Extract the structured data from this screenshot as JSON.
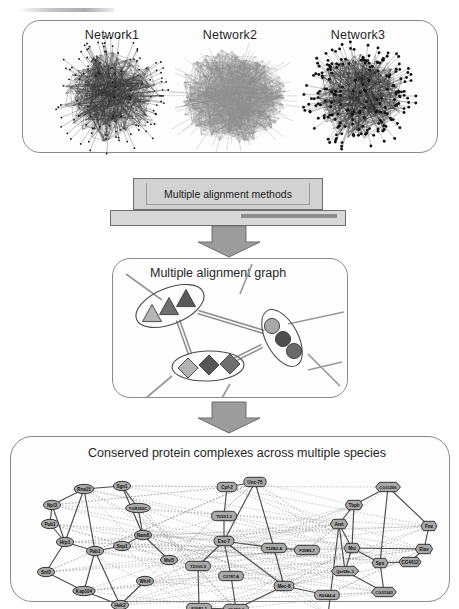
{
  "figure": {
    "domain": "biological-network-pipeline",
    "panels": [
      {
        "id": "networks",
        "title": ""
      },
      {
        "id": "methods",
        "title": "Multiple alignment methods"
      },
      {
        "id": "graph",
        "title": "Multiple alignment graph"
      },
      {
        "id": "complexes",
        "title": "Conserved protein complexes across multiple species"
      }
    ]
  },
  "networks_panel": {
    "items": [
      {
        "label": "Network1",
        "style": "sparse-hub-spokes",
        "seed": 11
      },
      {
        "label": "Network2",
        "style": "dense-light-fan",
        "seed": 27
      },
      {
        "label": "Network3",
        "style": "dotted-dark-core",
        "seed": 43
      }
    ]
  },
  "methods_stage": {
    "label": "Multiple alignment methods"
  },
  "graph_panel": {
    "title": "Multiple alignment graph",
    "clusters": [
      {
        "name": "triangle-cluster",
        "shape": "triangle",
        "count": 3,
        "fills": [
          "#b5b5b5",
          "#6e6e6e",
          "#5a5a5a"
        ]
      },
      {
        "name": "circle-cluster",
        "shape": "circle",
        "count": 3,
        "fills": [
          "#a8a8a8",
          "#4e4e4e",
          "#6a6a6a"
        ]
      },
      {
        "name": "diamond-cluster",
        "shape": "diamond",
        "count": 3,
        "fills": [
          "#b2b2b2",
          "#565656",
          "#707070"
        ]
      }
    ],
    "edge_style": "double-parallel-gray"
  },
  "complexes_panel": {
    "title": "Conserved protein complexes across multiple species",
    "species_groups": [
      {
        "name": "yeast",
        "shape": "ellipse",
        "nodes": [
          {
            "id": "Rna15",
            "label": "Rna15",
            "x": 72,
            "y": 27
          },
          {
            "id": "Sgn1",
            "label": "Sgn1",
            "x": 110,
            "y": 24
          },
          {
            "id": "Npl3",
            "label": "Npl3",
            "x": 40,
            "y": 43
          },
          {
            "id": "YGR250C",
            "label": "YGR250C",
            "x": 126,
            "y": 46
          },
          {
            "id": "Pub1",
            "label": "Pub1",
            "x": 38,
            "y": 62
          },
          {
            "id": "Nam8",
            "label": "Nam8",
            "x": 131,
            "y": 73
          },
          {
            "id": "Hrp1",
            "label": "Hrp1",
            "x": 53,
            "y": 80
          },
          {
            "id": "Pab1",
            "label": "Pab1",
            "x": 83,
            "y": 89
          },
          {
            "id": "Snp1",
            "label": "Snp1",
            "x": 110,
            "y": 84
          },
          {
            "id": "Msl5",
            "label": "Msl5",
            "x": 157,
            "y": 98
          },
          {
            "id": "Snf2",
            "label": "Snf2",
            "x": 34,
            "y": 110
          },
          {
            "id": "Whi4",
            "label": "Whi4",
            "x": 133,
            "y": 119
          },
          {
            "id": "Kap104",
            "label": "Kap104",
            "x": 72,
            "y": 129
          },
          {
            "id": "Hek2",
            "label": "Hek2",
            "x": 108,
            "y": 143
          }
        ]
      },
      {
        "name": "worm",
        "shape": "rounded-rect",
        "nodes": [
          {
            "id": "Cpf-2",
            "label": "Cpf-2",
            "x": 215,
            "y": 25
          },
          {
            "id": "Unc-75",
            "label": "Unc-75",
            "x": 243,
            "y": 20
          },
          {
            "id": "T01D1.2",
            "label": "T01D1.2",
            "x": 212,
            "y": 54
          },
          {
            "id": "Exc-7",
            "label": "Exc-7",
            "x": 212,
            "y": 79
          },
          {
            "id": "T22B2.A",
            "label": "T22B2.A",
            "x": 262,
            "y": 86
          },
          {
            "id": "F25B5.7",
            "label": "F25B5.7",
            "x": 295,
            "y": 88
          },
          {
            "id": "T21G5.5",
            "label": "T21G5.5",
            "x": 186,
            "y": 104
          },
          {
            "id": "C2787.A",
            "label": "C2787.A",
            "x": 219,
            "y": 114
          },
          {
            "id": "Mec-8",
            "label": "Mec-8",
            "x": 272,
            "y": 124
          },
          {
            "id": "R06A4.4",
            "label": "R06A4.4",
            "x": 315,
            "y": 133
          },
          {
            "id": "F26B1.2",
            "label": "F26B1.2",
            "x": 187,
            "y": 146
          },
          {
            "id": "C12D8.3",
            "label": "C12D8.3",
            "x": 224,
            "y": 147
          }
        ]
      },
      {
        "name": "fly",
        "shape": "hexagon",
        "nodes": [
          {
            "id": "CG11266",
            "label": "CG11266",
            "x": 376,
            "y": 25
          },
          {
            "id": "Tbph",
            "label": "Tbph",
            "x": 342,
            "y": 43
          },
          {
            "id": "Aret",
            "label": "Aret",
            "x": 327,
            "y": 62
          },
          {
            "id": "Fne",
            "label": "Fne",
            "x": 417,
            "y": 64
          },
          {
            "id": "Msi",
            "label": "Msi",
            "x": 340,
            "y": 86
          },
          {
            "id": "Elav",
            "label": "Elav",
            "x": 412,
            "y": 87
          },
          {
            "id": "Spx",
            "label": "Spx",
            "x": 368,
            "y": 101
          },
          {
            "id": "CG4612",
            "label": "CG4612",
            "x": 398,
            "y": 100
          },
          {
            "id": "Qkr58e-3",
            "label": "Qkr58e-3",
            "x": 333,
            "y": 109
          },
          {
            "id": "CG31243",
            "label": "CG31243",
            "x": 372,
            "y": 130
          },
          {
            "id": "Mub",
            "label": "Mub",
            "x": 316,
            "y": 153
          }
        ]
      }
    ],
    "edge_kinds": [
      {
        "kind": "intra-species",
        "style": "solid-dark"
      },
      {
        "kind": "cross-species",
        "style": "dotted-light"
      }
    ]
  },
  "colors": {
    "panel_border": "#8a8a8a",
    "node_fill": "#a9a9a9",
    "node_stroke": "#333333",
    "edge_solid": "#3a3a3a",
    "edge_dotted": "#9b9b9b",
    "arrow_fill": "#9c9c9c",
    "stage_box_fill": "#d2d2d2"
  }
}
